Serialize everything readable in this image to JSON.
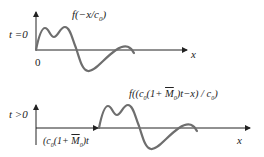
{
  "top_panel": {
    "t_label": "t =0",
    "origin_label": "0",
    "x_label": "x",
    "func_label": "f(−x/c",
    "func_sub": "0",
    "func_close": ")"
  },
  "bottom_panel": {
    "t_label": "t >0",
    "shift_label_a": "(c",
    "shift_sub_a": "0",
    "shift_label_b": "(1+ ",
    "shift_M": "M",
    "shift_sub_b": "0",
    "shift_label_c": ")t",
    "x_label": "x",
    "func_label": "f((c",
    "func_sub_a": "0",
    "func_mid": "(1+ ",
    "func_M": "M",
    "func_sub_b": "0",
    "func_tail": ")t−x) / c",
    "func_sub_c": "0",
    "func_close": ")"
  },
  "colors": {
    "curve": "#6e6e6e",
    "axis": "#222222"
  }
}
